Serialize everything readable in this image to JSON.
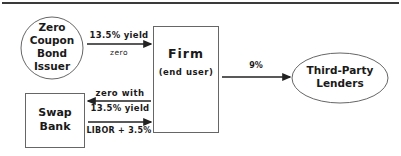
{
  "nodes": {
    "issuer": {
      "label_lines": [
        "Zero",
        "Coupon",
        "Bond",
        "Issuer"
      ],
      "shape": "circle"
    },
    "firm": {
      "title": "Firm",
      "subtitle": "(end user)",
      "shape": "rectangle"
    },
    "swap_bank": {
      "label_lines": [
        "Swap",
        "Bank"
      ],
      "shape": "rectangle"
    },
    "lenders": {
      "label_lines": [
        "Third-Party",
        "Lenders"
      ],
      "shape": "ellipse"
    }
  },
  "edges": {
    "issuer_to_firm": {
      "label_above": "13.5% yield",
      "label_below": "zero",
      "direction": "right"
    },
    "firm_to_swap": {
      "label_above": "zero with",
      "label_below": "13.5% yield",
      "direction": "left"
    },
    "swap_to_firm": {
      "label_below": "LIBOR + 3.5%",
      "direction": "right"
    },
    "firm_to_lenders": {
      "label_above": "9%",
      "direction": "right"
    }
  },
  "colors": {
    "stroke": "#555555",
    "text": "#1a1a1a",
    "background": "#ffffff"
  }
}
